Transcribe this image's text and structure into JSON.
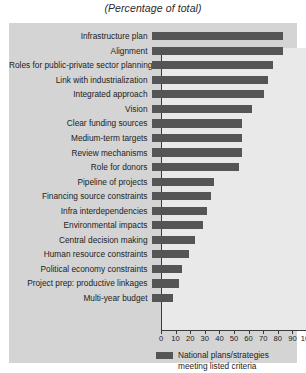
{
  "chart_data": {
    "type": "bar",
    "orientation": "horizontal",
    "title": "(Percentage of total)",
    "subtitle": "",
    "xlabel": "",
    "ylabel": "",
    "xlim": [
      0,
      100
    ],
    "grid": false,
    "legend_position": "bottom",
    "xticks": [
      0,
      10,
      20,
      30,
      40,
      50,
      60,
      70,
      80,
      90,
      100
    ],
    "xtick_labels": [
      "0",
      "10",
      "20",
      "30",
      "40",
      "50",
      "60",
      "70",
      "80",
      "90",
      "100"
    ],
    "categories": [
      "Infrastructure plan",
      "Alignment",
      "Roles for public-private sector planning",
      "Link with industrialization",
      "Integrated approach",
      "Vision",
      "Clear funding sources",
      "Medium-term targets",
      "Review mechanisms",
      "Role for donors",
      "Pipeline of projects",
      "Financing source constraints",
      "Infra interdependencies",
      "Environmental impacts",
      "Central decision making",
      "Human resource constraints",
      "Political economy constraints",
      "Project prep: productive linkages",
      "Multi-year budget"
    ],
    "series": [
      {
        "name": "National plans/strategies meeting listed criteria",
        "color": "#555555",
        "values": [
          90,
          90,
          83,
          80,
          77,
          69,
          62,
          62,
          62,
          60,
          43,
          41,
          38,
          35,
          30,
          26,
          21,
          19,
          15
        ]
      }
    ]
  },
  "legend": {
    "label": "National plans/strategies meeting listed criteria",
    "swatch_color": "#555555"
  }
}
